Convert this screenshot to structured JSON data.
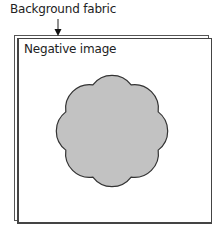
{
  "labels": {
    "background": "Background fabric",
    "negative": "Negative image"
  },
  "shape": {
    "type": "scalloped-flower",
    "lobes": 8,
    "fill": "#c2c2c2",
    "stroke": "#333333"
  }
}
